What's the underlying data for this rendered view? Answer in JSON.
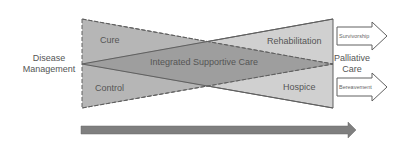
{
  "diagram": {
    "left_label": [
      "Disease",
      "Management"
    ],
    "right_label": [
      "Palliative",
      "Care"
    ],
    "regions": {
      "cure": "Cure",
      "control": "Control",
      "integrated": "Integrated Supportive Care",
      "rehabilitation": "Rehabilitation",
      "hospice": "Hospice"
    },
    "outcome_arrows": {
      "top": "Survivorship",
      "bottom": "Bereavement"
    },
    "timeline_arrow": "time-progression-arrow",
    "colors": {
      "dark_fill": "#a6a6a6",
      "overlap_fill": "#959595",
      "light_fill": "#d0d0d0",
      "stroke": "#606060",
      "arrow_fill": "#7f7f7f",
      "text": "#555555"
    }
  }
}
